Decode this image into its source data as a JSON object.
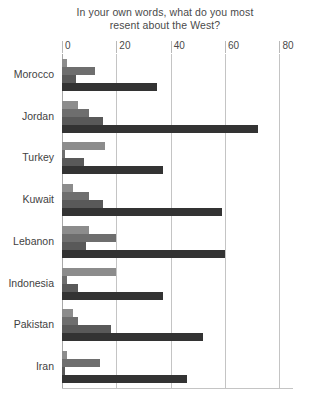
{
  "chart_data": {
    "type": "bar",
    "orientation": "horizontal",
    "title": "In your own words, what do you most resent about the West?",
    "title_line1": "In your own words, what do you most",
    "title_line2": "resent about the West?",
    "xlabel": "",
    "ylabel": "",
    "xlim": [
      0,
      85
    ],
    "xticks": [
      0,
      20,
      40,
      60,
      80
    ],
    "xtick_labels": [
      "0",
      "20",
      "40",
      "60",
      "80"
    ],
    "grid": true,
    "legend": "none",
    "categories": [
      "Morocco",
      "Jordan",
      "Turkey",
      "Kuwait",
      "Lebanon",
      "Indonesia",
      "Pakistan",
      "Iran"
    ],
    "series": [
      {
        "name": "Series 1",
        "color": "#8c8c8c",
        "values": [
          2,
          6,
          16,
          4,
          10,
          20,
          4,
          2
        ]
      },
      {
        "name": "Series 2",
        "color": "#6e6e6e",
        "values": [
          12,
          10,
          1,
          10,
          20,
          2,
          6,
          14
        ]
      },
      {
        "name": "Series 3",
        "color": "#595959",
        "values": [
          5,
          15,
          8,
          15,
          9,
          6,
          18,
          1
        ]
      },
      {
        "name": "Series 4",
        "color": "#333333",
        "values": [
          35,
          72,
          37,
          59,
          60,
          37,
          52,
          46
        ]
      }
    ]
  },
  "colors": {
    "background": "#ffffff",
    "gridline": "#c4c4c4",
    "axis": "#a8a8a8",
    "text": "#3f3f3f",
    "title": "#4a4a4a"
  }
}
